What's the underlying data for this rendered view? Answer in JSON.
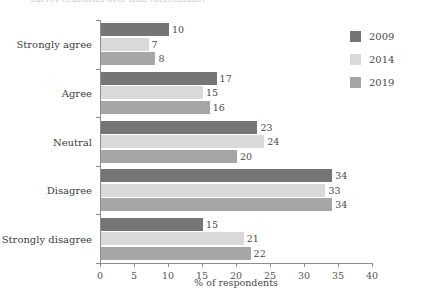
{
  "chart_data": {
    "type": "bar",
    "orientation": "horizontal",
    "title": "",
    "xlabel": "% of respondents",
    "ylabel": "",
    "xlim": [
      0,
      40
    ],
    "xticks": [
      0,
      5,
      10,
      15,
      20,
      25,
      30,
      35,
      40
    ],
    "grid": false,
    "legend_position": "right",
    "categories": [
      "Strongly agree",
      "Agree",
      "Neutral",
      "Disagree",
      "Strongly disagree"
    ],
    "series": [
      {
        "name": "2009",
        "color": "#757575",
        "values": [
          10,
          17,
          23,
          34,
          15
        ]
      },
      {
        "name": "2014",
        "color": "#d9d9d9",
        "values": [
          7,
          15,
          24,
          33,
          21
        ]
      },
      {
        "name": "2019",
        "color": "#a6a6a6",
        "values": [
          8,
          16,
          20,
          34,
          22
        ]
      }
    ]
  },
  "axis": {
    "x_title": "% of respondents",
    "tick_labels": [
      "0",
      "5",
      "10",
      "15",
      "20",
      "25",
      "30",
      "35",
      "40"
    ]
  },
  "legend": {
    "items": [
      {
        "label": "2009",
        "color": "#757575"
      },
      {
        "label": "2014",
        "color": "#d9d9d9"
      },
      {
        "label": "2019",
        "color": "#a6a6a6"
      }
    ]
  },
  "colors": {
    "series_2009": "#757575",
    "series_2014": "#d9d9d9",
    "series_2019": "#a6a6a6",
    "axis": "#8d8d8d",
    "text": "#3d3d3d",
    "background": "#ffffff"
  },
  "cut_off_title": "Survey responses over time (percentage)"
}
